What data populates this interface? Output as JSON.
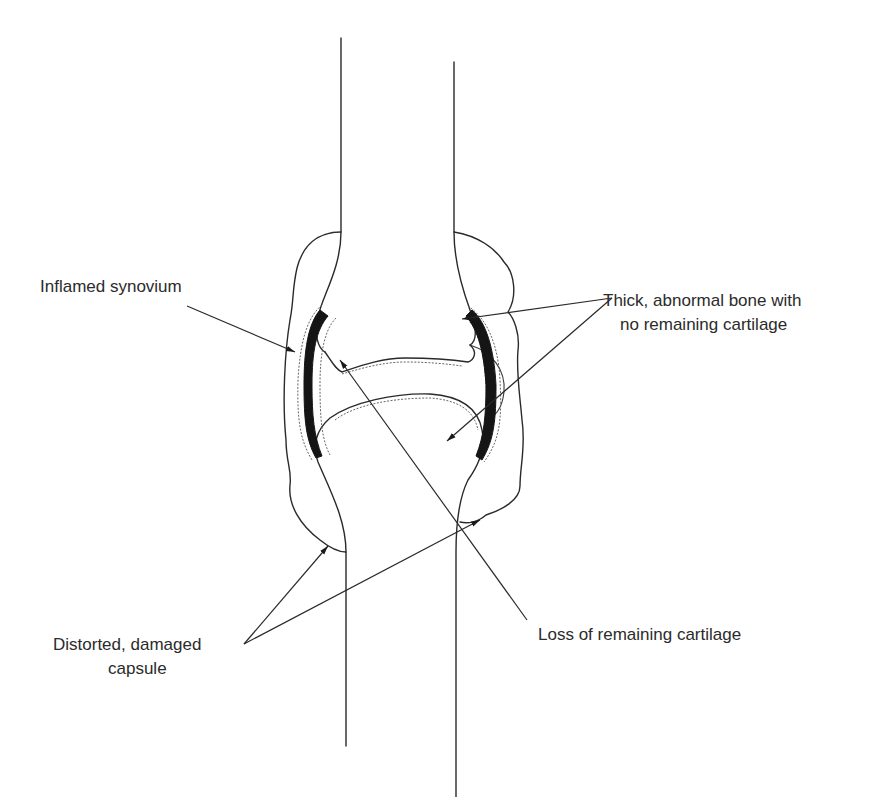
{
  "diagram": {
    "colors": {
      "line": "#2a2a2a",
      "synovium": "#151515",
      "text": "#2b2b2b",
      "background": "#ffffff"
    },
    "labels": {
      "inflamed_synovium": "Inflamed synovium",
      "thick_bone_line1": "Thick, abnormal bone with",
      "thick_bone_line2": "no remaining cartilage",
      "capsule_line1": "Distorted, damaged",
      "capsule_line2": "capsule",
      "loss_cartilage": "Loss of remaining cartilage"
    }
  }
}
